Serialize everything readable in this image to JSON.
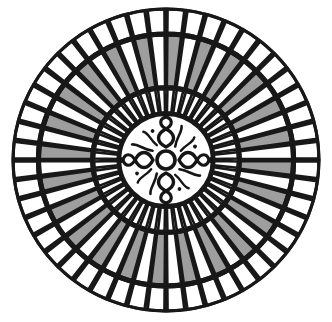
{
  "figure": {
    "canvas_width": 332,
    "canvas_height": 322,
    "background_color": "#ffffff"
  },
  "geometry": {
    "center_x": 166,
    "center_y": 160,
    "radius_x": 154,
    "radius_y": 152
  },
  "colors": {
    "stroke": "#181818",
    "fill_light": "#ffffff",
    "fill_gray": "#9e9e9e",
    "background": "#ffffff",
    "motif": "#151515"
  },
  "rings": [
    {
      "name": "outer-ring",
      "segments": 48,
      "inner_radius_ratio": 0.835,
      "outer_radius_ratio": 0.993,
      "stroke_width": 3.1,
      "pattern": "all-light",
      "fills": [
        "#ffffff"
      ],
      "angle_offset_deg": 3.75
    },
    {
      "name": "middle-ring",
      "segments": 48,
      "inner_radius_ratio": 0.482,
      "outer_radius_ratio": 0.822,
      "stroke_width": 3.1,
      "pattern": "alternating-gray-light",
      "fills": [
        "#9e9e9e",
        "#ffffff"
      ],
      "angle_offset_deg": 3.75
    },
    {
      "name": "inner-ring",
      "segments": 48,
      "inner_radius_ratio": 0.312,
      "outer_radius_ratio": 0.468,
      "stroke_width": 2.6,
      "pattern": "all-light",
      "fills": [
        "#ffffff"
      ],
      "angle_offset_deg": 3.75
    }
  ],
  "center_medallion": {
    "name": "center-medallion",
    "radius_ratio": 0.3,
    "fill": "#ffffff",
    "stroke_width": 3.0,
    "motif": {
      "name": "quatrefoil-cross-motif",
      "petal_count": 4,
      "petal_directions": [
        "up",
        "right",
        "down",
        "left"
      ],
      "hub_radius": 9,
      "has_flame_flourishes": true,
      "flourish_count": 4,
      "terminal_knob_count": 4,
      "description": "Four-petal quatrefoil cross with a round hub, flame-like flourishes between petals, and knobbed terminals"
    }
  },
  "labels": {
    "outer_ring": "Outer ring",
    "middle_ring": "Middle ring",
    "inner_ring": "Inner ring",
    "center": "Center medallion"
  }
}
